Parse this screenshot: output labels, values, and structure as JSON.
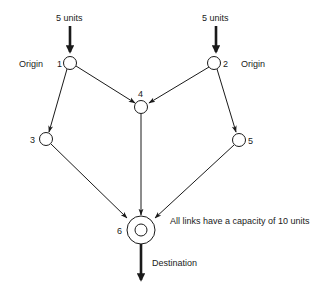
{
  "diagram": {
    "type": "network-flow",
    "supply_label": "5 units",
    "origin_label": "Origin",
    "destination_label": "Destination",
    "note": "All links have a capacity of 10 units",
    "nodes": [
      {
        "id": "1",
        "label": "1",
        "role": "Origin",
        "supply": "5 units"
      },
      {
        "id": "2",
        "label": "2",
        "role": "Origin",
        "supply": "5 units"
      },
      {
        "id": "3",
        "label": "3"
      },
      {
        "id": "4",
        "label": "4"
      },
      {
        "id": "5",
        "label": "5"
      },
      {
        "id": "6",
        "label": "6",
        "role": "Destination"
      }
    ],
    "edges": [
      {
        "from": "1",
        "to": "3"
      },
      {
        "from": "1",
        "to": "4"
      },
      {
        "from": "2",
        "to": "4"
      },
      {
        "from": "2",
        "to": "5"
      },
      {
        "from": "3",
        "to": "6"
      },
      {
        "from": "4",
        "to": "6"
      },
      {
        "from": "5",
        "to": "6"
      }
    ],
    "link_capacity": "10 units"
  }
}
